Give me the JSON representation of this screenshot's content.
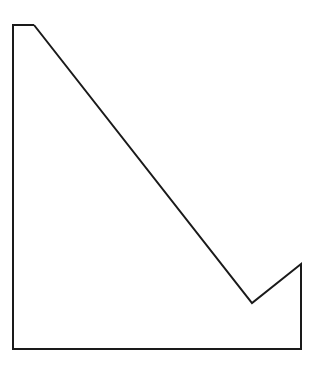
{
  "canvas": {
    "width": 315,
    "height": 365,
    "background_color": "#ffffff"
  },
  "figure": {
    "name": "polygon-outline",
    "stroke_color": "#1a1a1a",
    "stroke_width": 2,
    "fill": "none",
    "closed": true,
    "vertex_count": 7,
    "points": "34,25 252,303 301,264 301,349 13,349 13,25 34,25",
    "vertices": [
      {
        "label": "top-edge-right",
        "x": 34,
        "y": 25
      },
      {
        "label": "notch-bottom",
        "x": 252,
        "y": 303
      },
      {
        "label": "notch-peak",
        "x": 301,
        "y": 264
      },
      {
        "label": "bottom-right",
        "x": 301,
        "y": 349
      },
      {
        "label": "bottom-left",
        "x": 13,
        "y": 349
      },
      {
        "label": "top-left",
        "x": 13,
        "y": 25
      }
    ],
    "edges": [
      {
        "name": "long-descending-diagonal",
        "from": "top-edge-right",
        "to": "notch-bottom"
      },
      {
        "name": "notch-ascending-diagonal",
        "from": "notch-bottom",
        "to": "notch-peak"
      },
      {
        "name": "right-vertical-edge",
        "from": "notch-peak",
        "to": "bottom-right"
      },
      {
        "name": "bottom-horizontal-edge",
        "from": "bottom-right",
        "to": "bottom-left"
      },
      {
        "name": "left-vertical-edge",
        "from": "bottom-left",
        "to": "top-left"
      },
      {
        "name": "top-horizontal-edge",
        "from": "top-left",
        "to": "top-edge-right"
      }
    ]
  }
}
